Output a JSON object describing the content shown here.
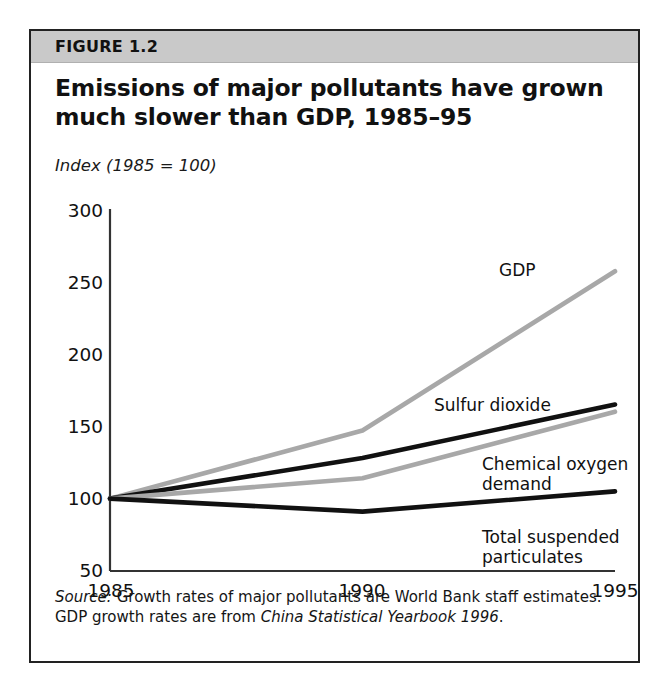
{
  "figure": {
    "number_label": "FIGURE 1.2",
    "title": "Emissions of major pollutants have grown much slower than GDP, 1985–95",
    "axis_note": "Index (1985 = 100)",
    "source_prefix": "Source:",
    "source_text_1": " Growth rates of major pollutants are World Bank staff estimates. GDP growth rates are from ",
    "source_italic": "China Statistical Yearbook 1996",
    "source_text_2": "."
  },
  "colors": {
    "band": "#c9c9c9",
    "frame": "#222222",
    "gray_series": "#a8a8a8",
    "black_series": "#111111",
    "axis": "#333333",
    "text": "#111111"
  },
  "chart_data": {
    "type": "line",
    "title": "Emissions of major pollutants have grown much slower than GDP, 1985–95",
    "subtitle": "Index (1985 = 100)",
    "xlabel": "",
    "ylabel": "Index (1985 = 100)",
    "x": [
      1985,
      1990,
      1995
    ],
    "xtick_labels": [
      "1985",
      "1990",
      "1995"
    ],
    "ytick_labels": [
      "50",
      "100",
      "150",
      "200",
      "250",
      "300"
    ],
    "yticks": [
      50,
      100,
      150,
      200,
      250,
      300
    ],
    "ylim": [
      50,
      300
    ],
    "xlim": [
      1985,
      1995
    ],
    "grid": false,
    "legend": "inline-labels",
    "series": [
      {
        "name": "GDP",
        "color": "#a8a8a8",
        "values": [
          100,
          147,
          257
        ],
        "label": "GDP"
      },
      {
        "name": "Sulfur dioxide",
        "color": "#111111",
        "values": [
          100,
          128,
          165
        ],
        "label": "Sulfur dioxide"
      },
      {
        "name": "Chemical oxygen demand",
        "color": "#a8a8a8",
        "values": [
          100,
          114,
          160
        ],
        "label": "Chemical oxygen\ndemand"
      },
      {
        "name": "Total suspended particulates",
        "color": "#111111",
        "values": [
          100,
          91,
          105
        ],
        "label": "Total suspended\nparticulates"
      }
    ],
    "annotations": [
      {
        "text": "GDP",
        "series": "GDP"
      },
      {
        "text": "Sulfur dioxide",
        "series": "Sulfur dioxide"
      },
      {
        "text": "Chemical oxygen demand",
        "series": "Chemical oxygen demand"
      },
      {
        "text": "Total suspended particulates",
        "series": "Total suspended particulates"
      }
    ]
  }
}
